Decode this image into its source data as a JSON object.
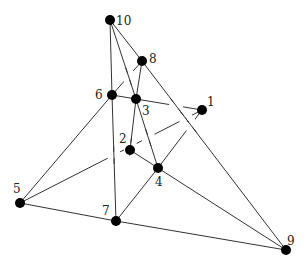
{
  "diagram": {
    "type": "graph",
    "nodes": [
      {
        "id": "1",
        "label": "1",
        "x": 202,
        "y": 110,
        "lx": 207,
        "ly": 106
      },
      {
        "id": "2",
        "label": "2",
        "x": 130,
        "y": 150,
        "lx": 119,
        "ly": 143
      },
      {
        "id": "3",
        "label": "3",
        "x": 136,
        "y": 99,
        "lx": 142,
        "ly": 115
      },
      {
        "id": "4",
        "label": "4",
        "x": 158,
        "y": 168,
        "lx": 155,
        "ly": 186
      },
      {
        "id": "5",
        "label": "5",
        "x": 20,
        "y": 203,
        "lx": 13,
        "ly": 193
      },
      {
        "id": "6",
        "label": "6",
        "x": 112,
        "y": 95,
        "lx": 95,
        "ly": 99
      },
      {
        "id": "7",
        "label": "7",
        "x": 116,
        "y": 221,
        "lx": 102,
        "ly": 215
      },
      {
        "id": "8",
        "label": "8",
        "x": 142,
        "y": 61,
        "lx": 149,
        "ly": 63
      },
      {
        "id": "9",
        "label": "9",
        "x": 286,
        "y": 250,
        "lx": 287,
        "ly": 245
      },
      {
        "id": "10",
        "label": "10",
        "x": 110,
        "y": 20,
        "lx": 116,
        "ly": 25
      }
    ],
    "edges": [
      {
        "from": "10",
        "to": "6"
      },
      {
        "from": "10",
        "to": "3"
      },
      {
        "from": "10",
        "to": "8"
      },
      {
        "from": "8",
        "to": "9"
      },
      {
        "from": "8",
        "to": "3"
      },
      {
        "from": "6",
        "to": "8",
        "broken": true
      },
      {
        "from": "6",
        "to": "3"
      },
      {
        "from": "6",
        "to": "7"
      },
      {
        "from": "6",
        "to": "5"
      },
      {
        "from": "3",
        "to": "1",
        "broken": true
      },
      {
        "from": "3",
        "to": "2"
      },
      {
        "from": "3",
        "to": "4"
      },
      {
        "from": "2",
        "to": "4"
      },
      {
        "from": "5",
        "to": "1",
        "broken": true
      },
      {
        "from": "5",
        "to": "7"
      },
      {
        "from": "4",
        "to": "1",
        "broken": true
      },
      {
        "from": "4",
        "to": "7"
      },
      {
        "from": "4",
        "to": "9"
      },
      {
        "from": "7",
        "to": "9"
      }
    ]
  }
}
